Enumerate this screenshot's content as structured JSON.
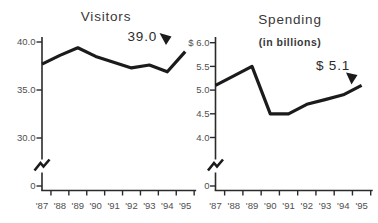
{
  "colors": {
    "background": "#ffffff",
    "line": "#1b1b1b",
    "axis": "#2a2a2a",
    "tick_label": "#4f4f4f",
    "title": "#383838"
  },
  "chart_data": [
    {
      "type": "line",
      "title": "Visitors",
      "categories": [
        "'87",
        "'88",
        "'89",
        "'90",
        "'91",
        "'92",
        "'93",
        "'94",
        "'95"
      ],
      "values": [
        37.7,
        38.6,
        39.4,
        38.5,
        37.9,
        37.3,
        37.6,
        36.9,
        39.0
      ],
      "y_ticks": [
        {
          "label": "40.0",
          "value": 40.0
        },
        {
          "label": "35.0",
          "value": 35.0
        },
        {
          "label": "30.0",
          "value": 30.0
        }
      ],
      "zero_label": "0",
      "axis_break": true,
      "grid": false,
      "ylim": [
        0,
        41
      ],
      "annotation": {
        "text": "39.0",
        "target_category": "'95",
        "target_value": 39.0
      }
    },
    {
      "type": "line",
      "title": "Spending",
      "subtitle": "(in billions)",
      "categories": [
        "'87",
        "'88",
        "'89",
        "'90",
        "'91",
        "'92",
        "'93",
        "'94",
        "'95"
      ],
      "values": [
        5.1,
        5.3,
        5.5,
        4.5,
        4.5,
        4.7,
        4.8,
        4.9,
        5.1
      ],
      "y_ticks": [
        {
          "label": "$ 6.0",
          "value": 6.0
        },
        {
          "label": "5.5",
          "value": 5.5
        },
        {
          "label": "5.0",
          "value": 5.0
        },
        {
          "label": "4.5",
          "value": 4.5
        },
        {
          "label": "4.0",
          "value": 4.0
        }
      ],
      "zero_label": "0",
      "axis_break": true,
      "grid": false,
      "ylim": [
        0,
        6.2
      ],
      "annotation": {
        "text": "$ 5.1",
        "target_category": "'95",
        "target_value": 5.1
      }
    }
  ]
}
